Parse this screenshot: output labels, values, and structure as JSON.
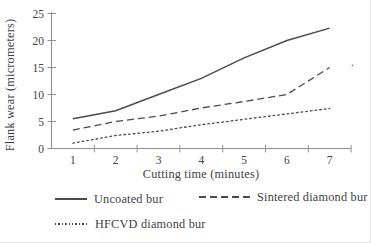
{
  "chart_data": {
    "type": "line",
    "title": "",
    "xlabel": "Cutting time (minutes)",
    "ylabel": "Flank wear (micrometers)",
    "x": [
      1,
      2,
      3,
      4,
      5,
      6,
      7
    ],
    "x_tick_labels": [
      "1",
      "2",
      "3",
      "4",
      "5",
      "6",
      "7"
    ],
    "y_ticks": [
      0,
      5,
      10,
      15,
      20,
      25
    ],
    "ylim": [
      0,
      25
    ],
    "grid": "off",
    "legend_position": "below-plot",
    "series": [
      {
        "name": "Uncoated bur",
        "line_style": "solid",
        "values": [
          5.5,
          7,
          10,
          13,
          16.8,
          20,
          22.3
        ]
      },
      {
        "name": "Sintered diamond bur",
        "line_style": "dashed",
        "values": [
          3.4,
          5,
          6,
          7.5,
          8.7,
          10,
          15
        ]
      },
      {
        "name": "HFCVD diamond bur",
        "line_style": "dotted",
        "values": [
          1,
          2.4,
          3.2,
          4.4,
          5.4,
          6.4,
          7.4
        ]
      }
    ],
    "colors": {
      "line": "#4a4a4a",
      "axis": "#8f8f8f",
      "text": "#3f3f3f"
    }
  }
}
